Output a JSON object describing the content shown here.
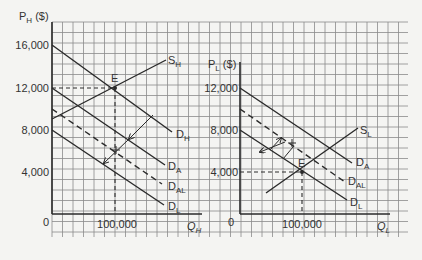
{
  "chart_data": [
    {
      "type": "line",
      "title": "",
      "ylabel": "P_H ($)",
      "xlabel": "Q_H",
      "ylim": [
        0,
        16000
      ],
      "y_ticks": [
        "0",
        "4,000",
        "8,000",
        "12,000",
        "16,000"
      ],
      "x_ticks": [
        "100,000"
      ],
      "grid": true,
      "series": [
        {
          "name": "S_H",
          "style": "solid",
          "points": [
            [
              0,
              9000
            ],
            [
              150000,
              15500
            ]
          ]
        },
        {
          "name": "D_H",
          "style": "solid",
          "points": [
            [
              0,
              16000
            ],
            [
              190000,
              7700
            ]
          ]
        },
        {
          "name": "D_A",
          "style": "solid",
          "points": [
            [
              0,
              12000
            ],
            [
              180000,
              4600
            ]
          ]
        },
        {
          "name": "D_AL",
          "style": "dashed",
          "points": [
            [
              0,
              10000
            ],
            [
              175000,
              2700
            ]
          ]
        },
        {
          "name": "D_L",
          "style": "solid",
          "points": [
            [
              0,
              8000
            ],
            [
              180000,
              900
            ]
          ]
        }
      ],
      "annotations": [
        {
          "label": "E",
          "x": 100000,
          "y": 12000
        },
        {
          "guide": "dashed",
          "from": [
            0,
            12000
          ],
          "to": [
            100000,
            12000
          ]
        },
        {
          "guide": "dashed",
          "from": [
            100000,
            12000
          ],
          "to": [
            100000,
            0
          ]
        },
        {
          "arrow": "shift",
          "from": "D_H",
          "to": "D_A"
        },
        {
          "arrow": "shift",
          "from": "D_A",
          "to": "D_L"
        }
      ]
    },
    {
      "type": "line",
      "title": "",
      "ylabel": "P_L ($)",
      "xlabel": "Q_L",
      "ylim": [
        0,
        12000
      ],
      "y_ticks": [
        "0",
        "4,000",
        "8,000",
        "12,000"
      ],
      "x_ticks": [
        "100,000"
      ],
      "grid": true,
      "series": [
        {
          "name": "S_L",
          "style": "solid",
          "points": [
            [
              40000,
              2000
            ],
            [
              190000,
              8200
            ]
          ]
        },
        {
          "name": "D_A",
          "style": "solid",
          "points": [
            [
              0,
              12000
            ],
            [
              180000,
              4800
            ]
          ]
        },
        {
          "name": "D_AL",
          "style": "dashed",
          "points": [
            [
              0,
              10000
            ],
            [
              170000,
              2800
            ]
          ]
        },
        {
          "name": "D_L",
          "style": "solid",
          "points": [
            [
              0,
              8000
            ],
            [
              175000,
              1400
            ]
          ]
        }
      ],
      "annotations": [
        {
          "label": "E",
          "x": 100000,
          "y": 4000
        },
        {
          "guide": "dashed",
          "from": [
            0,
            4000
          ],
          "to": [
            100000,
            4000
          ]
        },
        {
          "guide": "dashed",
          "from": [
            100000,
            4000
          ],
          "to": [
            100000,
            0
          ]
        },
        {
          "arrow": "shift",
          "from": "D_A",
          "to": "D_L"
        },
        {
          "arrow": "shift",
          "from": "D_L",
          "to": "D_A"
        }
      ]
    }
  ],
  "left": {
    "ylabel_main": "P",
    "ylabel_sub": "H",
    "ylabel_unit": " ($)",
    "y_ticks": [
      "16,000",
      "12,000",
      "8,000",
      "4,000",
      "0"
    ],
    "x_tick": "100,000",
    "xlabel_main": "Q",
    "xlabel_sub": "H",
    "eq_label": "E",
    "curves": {
      "SH": {
        "main": "S",
        "sub": "H"
      },
      "DH": {
        "main": "D",
        "sub": "H"
      },
      "DA": {
        "main": "D",
        "sub": "A"
      },
      "DAL": {
        "main": "D",
        "sub": "AL"
      },
      "DL": {
        "main": "D",
        "sub": "L"
      }
    }
  },
  "right": {
    "ylabel_main": "P",
    "ylabel_sub": "L",
    "ylabel_unit": " ($)",
    "y_ticks": [
      "12,000",
      "8,000",
      "4,000",
      "0"
    ],
    "x_tick": "100,000",
    "xlabel_main": "Q",
    "xlabel_sub": "L",
    "eq_label": "E",
    "curves": {
      "SL": {
        "main": "S",
        "sub": "L"
      },
      "DA": {
        "main": "D",
        "sub": "A"
      },
      "DAL": {
        "main": "D",
        "sub": "AL"
      },
      "DL": {
        "main": "D",
        "sub": "L"
      }
    }
  },
  "colors": {
    "background": "#f4f4f2",
    "grid": "#8a8a8a",
    "line": "#2a2a2a",
    "text": "#333333"
  }
}
